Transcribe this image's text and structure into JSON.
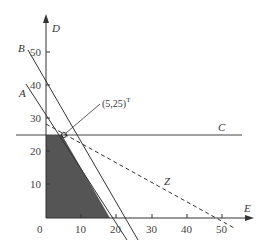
{
  "diagram": {
    "type": "linear-programming-feasible-region",
    "axes": {
      "x_label": "E",
      "y_label": "D",
      "x_ticks": [
        "0",
        "10",
        "20",
        "30",
        "40",
        "50"
      ],
      "y_ticks": [
        "10",
        "20",
        "30",
        "40",
        "50"
      ]
    },
    "lines": [
      {
        "label": "A",
        "style": "solid"
      },
      {
        "label": "B",
        "style": "solid"
      },
      {
        "label": "C",
        "style": "solid"
      },
      {
        "label": "Z",
        "style": "dashed"
      }
    ],
    "optimal_point": {
      "label": "(5,25)",
      "superscript": "T"
    },
    "colors": {
      "feasible_region": "#555555",
      "lines": "#333333"
    }
  }
}
